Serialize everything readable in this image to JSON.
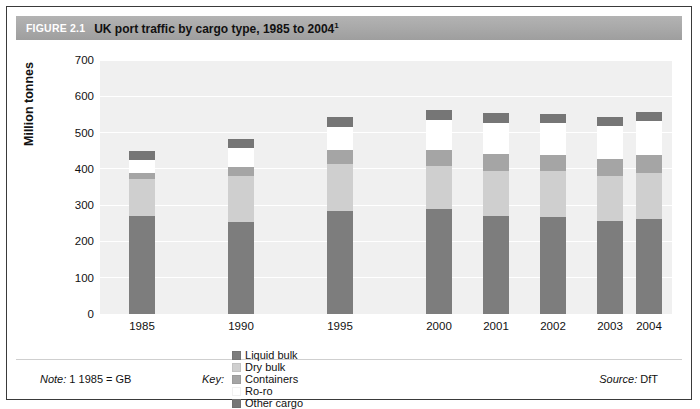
{
  "figure": {
    "number_label": "FIGURE 2.1",
    "title": "UK port traffic by cargo type, 1985 to 2004",
    "title_superscript": "1"
  },
  "footer": {
    "note_label": "Note:",
    "note_text": "1 1985 = GB",
    "key_label": "Key:",
    "source_label": "Source:",
    "source_text": "DfT"
  },
  "colors": {
    "header_bar": "#a8a8a8",
    "plot_background": "#f0f0f0",
    "gridline": "#ffffff",
    "liquid_bulk": "#7d7d7d",
    "dry_bulk": "#cfcfcf",
    "containers": "#a5a5a5",
    "ro_ro": "#ffffff",
    "other_cargo": "#767676"
  },
  "chart_data": {
    "type": "bar",
    "title": "UK port traffic by cargo type, 1985 to 2004",
    "xlabel": "",
    "ylabel": "Million tonnes",
    "ylim": [
      0,
      700
    ],
    "yticks": [
      0,
      100,
      200,
      300,
      400,
      500,
      600,
      700
    ],
    "ytick_labels": [
      "0",
      "100",
      "200",
      "300",
      "400",
      "500",
      "600",
      "700"
    ],
    "grid": true,
    "stacked": true,
    "legend_position": "bottom",
    "categories": [
      "1985",
      "1990",
      "1995",
      "2000",
      "2001",
      "2002",
      "2003",
      "2004"
    ],
    "series": [
      {
        "name": "Liquid bulk",
        "color": "#7d7d7d",
        "values": [
          271,
          254,
          285,
          289,
          271,
          268,
          256,
          263
        ]
      },
      {
        "name": "Dry bulk",
        "color": "#cfcfcf",
        "values": [
          101,
          127,
          128,
          120,
          123,
          126,
          125,
          126
        ]
      },
      {
        "name": "Containers",
        "color": "#a5a5a5",
        "values": [
          18,
          24,
          38,
          44,
          46,
          44,
          46,
          49
        ]
      },
      {
        "name": "Ro-ro",
        "color": "#ffffff",
        "values": [
          34,
          52,
          64,
          81,
          87,
          89,
          92,
          95
        ]
      },
      {
        "name": "Other cargo",
        "color": "#767676",
        "values": [
          24,
          26,
          27,
          28,
          27,
          25,
          24,
          24
        ]
      }
    ],
    "totals": [
      448,
      483,
      542,
      562,
      554,
      552,
      543,
      557
    ]
  }
}
